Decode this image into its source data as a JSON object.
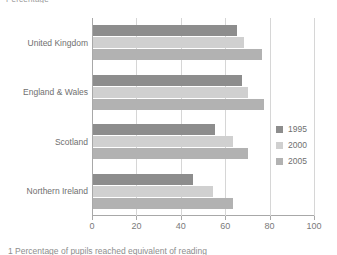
{
  "figure": {
    "axis_title_top": "Percentage",
    "caption": "1 Percentage of pupils reached equivalent of reading"
  },
  "legend": {
    "position": "right",
    "entries": [
      {
        "label": "1995",
        "color": "#8d8d8d"
      },
      {
        "label": "2000",
        "color": "#d0d0d0"
      },
      {
        "label": "2005",
        "color": "#b2b2b2"
      }
    ]
  },
  "chart_data": {
    "type": "bar",
    "orientation": "horizontal",
    "title": "",
    "subtitle": "",
    "xlabel": "Percentage",
    "ylabel": "",
    "xlim": [
      0,
      100
    ],
    "xticks": [
      0,
      20,
      40,
      60,
      80,
      100
    ],
    "grid": true,
    "categories": [
      "United Kingdom",
      "England & Wales",
      "Scotland",
      "Northern Ireland"
    ],
    "series": [
      {
        "name": "1995",
        "color": "#8d8d8d",
        "values": [
          65,
          67,
          55,
          45
        ]
      },
      {
        "name": "2000",
        "color": "#d0d0d0",
        "values": [
          68,
          70,
          63,
          54
        ]
      },
      {
        "name": "2005",
        "color": "#b2b2b2",
        "values": [
          76,
          77,
          70,
          63
        ]
      }
    ],
    "annotations": []
  }
}
